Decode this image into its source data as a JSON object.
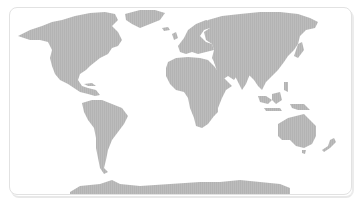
{
  "map": {
    "type": "world-map",
    "projection": "equirectangular-like",
    "colors": {
      "background": "#ffffff",
      "land": "#b9b9b9",
      "frame_border": "#e2e2e2"
    },
    "regions": [
      "north-america",
      "greenland",
      "south-america",
      "europe",
      "africa",
      "asia",
      "australia",
      "antarctica",
      "indonesia",
      "japan",
      "new-zealand",
      "madagascar",
      "uk",
      "iceland"
    ]
  }
}
